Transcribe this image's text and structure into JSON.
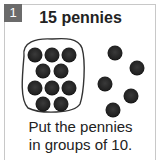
{
  "problem": {
    "number": "1",
    "title": "15 pennies",
    "instruction_line1": "Put the pennies",
    "instruction_line2": "in groups of 10."
  },
  "colors": {
    "badge": "#6b6b6b",
    "coin": "#262626",
    "border": "#c8c8c8"
  },
  "pennies": {
    "total": 15,
    "grouped": 10,
    "loose": 5
  }
}
